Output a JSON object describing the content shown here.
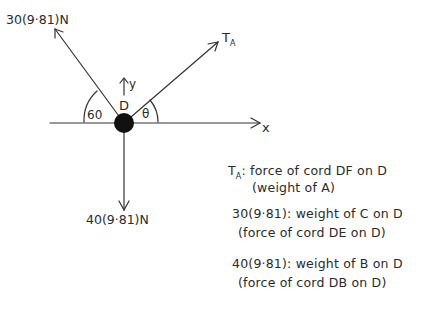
{
  "diagram": {
    "type": "free-body-diagram",
    "point": "D",
    "axes": {
      "x": "x",
      "y": "y"
    },
    "forces": [
      {
        "id": "left",
        "label": "30(9·81)N",
        "angle_label": "60"
      },
      {
        "id": "right",
        "label_main": "T",
        "label_sub": "A",
        "angle_label": "θ"
      },
      {
        "id": "down",
        "label": "40(9·81)N"
      }
    ]
  },
  "notes": [
    {
      "head": "T",
      "head_sub": "A",
      "line1": ": force of cord DF on D",
      "line2": "(weight of A)"
    },
    {
      "line1": "30(9·81): weight of C on D",
      "line2": "(force of cord DE on D)"
    },
    {
      "line1": "40(9·81): weight of B on D",
      "line2": "(force of cord DB on D)"
    }
  ]
}
